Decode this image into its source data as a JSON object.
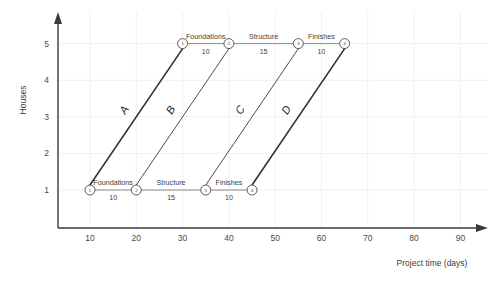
{
  "chart_data": {
    "type": "line",
    "title": "",
    "xlabel": "Project time (days)",
    "ylabel": "Houses",
    "xlim": [
      0,
      95
    ],
    "ylim": [
      0,
      5.6
    ],
    "xticks": [
      10,
      20,
      30,
      40,
      50,
      60,
      70,
      80,
      90
    ],
    "yticks": [
      1,
      2,
      3,
      4,
      5
    ],
    "grid": true,
    "legend_position": "none",
    "activities": [
      {
        "name": "Foundations",
        "duration": "10"
      },
      {
        "name": "Structure",
        "duration": "15"
      },
      {
        "name": "Finishes",
        "duration": "10"
      }
    ],
    "chains": [
      {
        "id": "house-1",
        "house": 1,
        "nodes": [
          {
            "label": "1",
            "day": 10
          },
          {
            "label": "2",
            "day": 20
          },
          {
            "label": "3",
            "day": 35
          },
          {
            "label": "4",
            "day": 45
          }
        ],
        "segments": [
          {
            "name": "Foundations",
            "duration": "10",
            "from_day": 10,
            "to_day": 20
          },
          {
            "name": "Structure",
            "duration": "15",
            "from_day": 20,
            "to_day": 35
          },
          {
            "name": "Finishes",
            "duration": "10",
            "from_day": 35,
            "to_day": 45
          }
        ]
      },
      {
        "id": "house-5",
        "house": 5,
        "nodes": [
          {
            "label": "1",
            "day": 30
          },
          {
            "label": "2",
            "day": 40
          },
          {
            "label": "3",
            "day": 55
          },
          {
            "label": "4",
            "day": 65
          }
        ],
        "segments": [
          {
            "name": "Foundations",
            "duration": "10",
            "from_day": 30,
            "to_day": 40
          },
          {
            "name": "Structure",
            "duration": "15",
            "from_day": 40,
            "to_day": 55
          },
          {
            "name": "Finishes",
            "duration": "10",
            "from_day": 55,
            "to_day": 65
          }
        ]
      }
    ],
    "balance_lines": [
      {
        "label": "A",
        "from": {
          "day": 10,
          "house": 1
        },
        "to": {
          "day": 30,
          "house": 5
        },
        "emphasis": "thick"
      },
      {
        "label": "B",
        "from": {
          "day": 20,
          "house": 1
        },
        "to": {
          "day": 40,
          "house": 5
        },
        "emphasis": "thin"
      },
      {
        "label": "C",
        "from": {
          "day": 35,
          "house": 1
        },
        "to": {
          "day": 55,
          "house": 5
        },
        "emphasis": "thin"
      },
      {
        "label": "D",
        "from": {
          "day": 45,
          "house": 1
        },
        "to": {
          "day": 65,
          "house": 5
        },
        "emphasis": "thick"
      }
    ],
    "colors": {
      "background": "#ffffff",
      "grid": "#f0f0f2",
      "axis": "#3a3a3a",
      "line": "#2e2e2e",
      "chain": "#8a8a8a",
      "text": "#3c3c3c"
    }
  }
}
